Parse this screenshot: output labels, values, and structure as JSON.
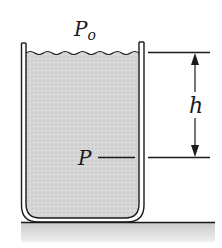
{
  "diagram": {
    "type": "hydrostatic-pressure",
    "labels": {
      "surface_pressure": "P",
      "surface_pressure_subscript": "o",
      "depth_pressure": "P",
      "depth": "h"
    },
    "colors": {
      "stroke": "#1a1a1a",
      "liquid": "#d4d4d4",
      "ground": "#cfcfcf",
      "background": "#ffffff"
    }
  }
}
